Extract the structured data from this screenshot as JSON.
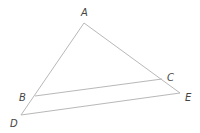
{
  "diagram": {
    "type": "geometry",
    "points": {
      "A": {
        "label": "A",
        "x": 84,
        "y": 23,
        "label_x": 81,
        "label_y": 16
      },
      "B": {
        "label": "B",
        "x": 35,
        "y": 96,
        "label_x": 19,
        "label_y": 101
      },
      "C": {
        "label": "C",
        "x": 162,
        "y": 79,
        "label_x": 167,
        "label_y": 81
      },
      "D": {
        "label": "D",
        "x": 21,
        "y": 115,
        "label_x": 10,
        "label_y": 127
      },
      "E": {
        "label": "E",
        "x": 180,
        "y": 93,
        "label_x": 185,
        "label_y": 101
      }
    },
    "segments": [
      {
        "name": "AD",
        "from": "A",
        "to": "D"
      },
      {
        "name": "AE",
        "from": "A",
        "to": "E"
      },
      {
        "name": "DE",
        "from": "D",
        "to": "E"
      },
      {
        "name": "BC",
        "from": "B",
        "to": "C"
      }
    ],
    "colors": {
      "line": "#b8b8b8",
      "label": "#444444",
      "background": "#ffffff"
    }
  }
}
